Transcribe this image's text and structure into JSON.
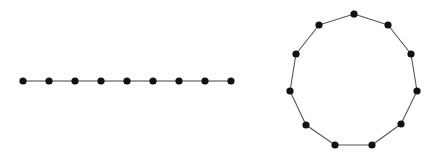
{
  "colors": {
    "edge": "#555555",
    "node": "#111111",
    "background": "#ffffff"
  },
  "node_radius": 3.6,
  "graphs": [
    {
      "name": "path-graph",
      "type": "path",
      "nodes": [
        [
          23,
          81
        ],
        [
          49,
          81
        ],
        [
          75,
          81
        ],
        [
          101,
          81
        ],
        [
          127,
          81
        ],
        [
          153,
          81
        ],
        [
          179,
          81
        ],
        [
          205,
          81
        ],
        [
          231,
          81
        ]
      ],
      "closed": false
    },
    {
      "name": "cycle-graph",
      "type": "cycle",
      "nodes": [
        [
          354,
          14
        ],
        [
          388,
          25
        ],
        [
          411,
          54
        ],
        [
          417,
          91
        ],
        [
          401,
          124
        ],
        [
          372,
          145
        ],
        [
          335,
          145
        ],
        [
          306,
          125
        ],
        [
          290,
          91
        ],
        [
          296,
          54
        ],
        [
          319,
          25
        ]
      ],
      "closed": true
    }
  ]
}
